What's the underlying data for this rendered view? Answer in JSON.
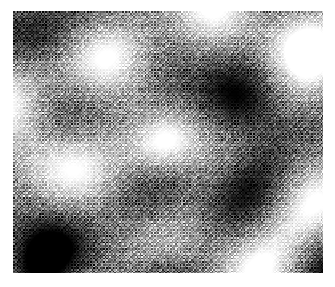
{
  "figure": {
    "title": "",
    "background_color": "#ffffff",
    "width": 335,
    "height": 287
  },
  "plot": {
    "name": "speckle-intensity-map",
    "left": 13,
    "top": 11,
    "width": 310,
    "height": 262,
    "colormap": "grayscale",
    "min_color": "#000000",
    "max_color": "#ffffff",
    "mid_color": "#808080",
    "axes_visible": false,
    "tick_labels_visible": false,
    "legend_visible": false,
    "colorbar_visible": false,
    "border_visible": false
  },
  "chart_data": {
    "type": "heatmap",
    "title": "",
    "xlabel": "",
    "ylabel": "",
    "colormap": "gray",
    "grid": false,
    "legend": "none",
    "xlim": [
      0,
      310
    ],
    "ylim": [
      0,
      262
    ],
    "zlim": [
      0,
      255
    ],
    "render": {
      "texture": "ordered-dither-halftone",
      "cell_size_px": 1.6,
      "dither_amplitude": 0.42,
      "diagonal_hatch_angle_deg": 45,
      "noise_seed": 20240117,
      "base_level": 0.5,
      "gamma": 1.0
    },
    "hot_spot": {
      "x": 148,
      "y": 131,
      "radius": 46,
      "peak_intensity": 255
    },
    "gaussian_lobes": [
      {
        "x": 148,
        "y": 131,
        "sx": 30,
        "sy": 24,
        "rot_deg": -30,
        "amp": 0.95,
        "label": "central-peak"
      },
      {
        "x": 78,
        "y": 44,
        "sx": 52,
        "sy": 30,
        "rot_deg": -38,
        "amp": 0.6,
        "label": "bright-upper-left"
      },
      {
        "x": 186,
        "y": 22,
        "sx": 46,
        "sy": 26,
        "rot_deg": -34,
        "amp": 0.52,
        "label": "bright-top-center"
      },
      {
        "x": 276,
        "y": 70,
        "sx": 44,
        "sy": 30,
        "rot_deg": -40,
        "amp": 0.5,
        "label": "bright-upper-right"
      },
      {
        "x": 22,
        "y": 118,
        "sx": 36,
        "sy": 34,
        "rot_deg": 0,
        "amp": 0.55,
        "label": "bright-left-edge"
      },
      {
        "x": 300,
        "y": 178,
        "sx": 36,
        "sy": 34,
        "rot_deg": 0,
        "amp": 0.5,
        "label": "bright-right-edge"
      },
      {
        "x": 96,
        "y": 216,
        "sx": 44,
        "sy": 30,
        "rot_deg": -35,
        "amp": 0.48,
        "label": "bright-lower-left"
      },
      {
        "x": 232,
        "y": 244,
        "sx": 46,
        "sy": 28,
        "rot_deg": -32,
        "amp": 0.5,
        "label": "bright-lower-right"
      },
      {
        "x": 18,
        "y": 18,
        "sx": 30,
        "sy": 26,
        "rot_deg": -30,
        "amp": -0.55,
        "label": "dark-top-left-corner"
      },
      {
        "x": 152,
        "y": 46,
        "sx": 40,
        "sy": 24,
        "rot_deg": -30,
        "amp": -0.45,
        "label": "dark-upper-mid"
      },
      {
        "x": 236,
        "y": 86,
        "sx": 42,
        "sy": 30,
        "rot_deg": -35,
        "amp": -0.58,
        "label": "dark-upper-right"
      },
      {
        "x": 50,
        "y": 106,
        "sx": 40,
        "sy": 26,
        "rot_deg": -35,
        "amp": -0.5,
        "label": "dark-left-mid"
      },
      {
        "x": 132,
        "y": 186,
        "sx": 46,
        "sy": 28,
        "rot_deg": -32,
        "amp": -0.58,
        "label": "dark-center-lower"
      },
      {
        "x": 258,
        "y": 160,
        "sx": 36,
        "sy": 26,
        "rot_deg": -30,
        "amp": -0.42,
        "label": "dark-right-mid"
      },
      {
        "x": 30,
        "y": 250,
        "sx": 38,
        "sy": 26,
        "rot_deg": -30,
        "amp": -0.55,
        "label": "dark-bottom-left"
      },
      {
        "x": 176,
        "y": 258,
        "sx": 40,
        "sy": 24,
        "rot_deg": -30,
        "amp": -0.48,
        "label": "dark-bottom-mid"
      },
      {
        "x": 306,
        "y": 248,
        "sx": 32,
        "sy": 26,
        "rot_deg": -30,
        "amp": -0.4,
        "label": "dark-bottom-right"
      }
    ],
    "carrier_waves": [
      {
        "kx": 0.043,
        "ky": 0.032,
        "phase": 0.6,
        "amp": 0.15
      },
      {
        "kx": -0.03,
        "ky": 0.046,
        "phase": 2.1,
        "amp": 0.12
      },
      {
        "kx": 0.017,
        "ky": -0.025,
        "phase": 4.0,
        "amp": 0.1
      },
      {
        "kx": 0.062,
        "ky": 0.009,
        "phase": 1.35,
        "amp": 0.07
      },
      {
        "kx": 0.009,
        "ky": 0.061,
        "phase": 3.3,
        "amp": 0.07
      }
    ]
  }
}
